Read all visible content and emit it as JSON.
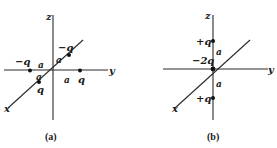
{
  "figure": {
    "panels": [
      {
        "id": "a",
        "caption": "(a)",
        "axes": {
          "z": "z",
          "y": "y",
          "x": "x"
        },
        "charges": [
          {
            "label": "−q",
            "position": "on −y axis, distance a"
          },
          {
            "label": "q",
            "position": "on +y axis, distance a"
          },
          {
            "label": "q",
            "position": "on +x axis, distance a"
          },
          {
            "label": "−q",
            "position": "on −x axis, distance a"
          }
        ],
        "distance_labels": [
          "a",
          "a",
          "a",
          "a"
        ]
      },
      {
        "id": "b",
        "caption": "(b)",
        "axes": {
          "z": "z",
          "y": "y",
          "x": "x"
        },
        "charges": [
          {
            "label": "+q",
            "position": "on +z axis, distance a"
          },
          {
            "label": "−2q",
            "position": "origin"
          },
          {
            "label": "+q",
            "position": "on −z axis, distance a"
          }
        ],
        "distance_labels": [
          "a",
          "a"
        ]
      }
    ]
  }
}
